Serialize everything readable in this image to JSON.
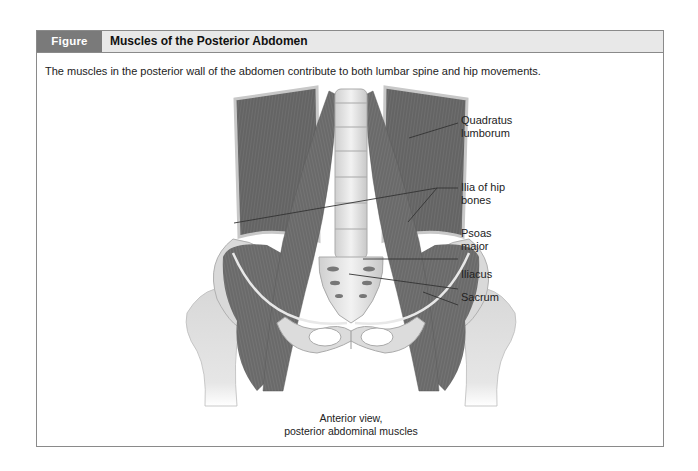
{
  "figure": {
    "number": "Figure 13.11",
    "title": "Muscles of the Posterior Abdomen",
    "caption": "The muscles in the posterior wall of the abdomen contribute to both lumbar spine and hip movements."
  },
  "illustration": {
    "labels": [
      {
        "line1": "Quadratus",
        "line2": "lumborum"
      },
      {
        "line1": "Ilia of hip",
        "line2": "bones"
      },
      {
        "line1": "Psoas",
        "line2": "major"
      },
      {
        "line1": "Iliacus",
        "line2": ""
      },
      {
        "line1": "Sacrum",
        "line2": ""
      }
    ],
    "view_caption": {
      "line1": "Anterior view,",
      "line2": "posterior abdominal muscles"
    }
  },
  "colors": {
    "figure_number_bg": "#7a7a7a",
    "header_bg": "#e8e8e8",
    "border": "#8a8a8a"
  }
}
